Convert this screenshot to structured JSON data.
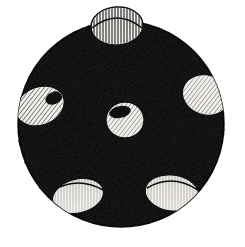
{
  "figure": {
    "style": "pen-and-ink engraving / woodcut stipple",
    "alt_text": "A large black stippled circle occupying most of the frame, with six pale oval craters hatched with fine ink lines; one crater forms a dome bulging above the top edge of the circle.",
    "canvas": {
      "width": 245,
      "height": 247,
      "background_color": "#ffffff"
    },
    "body": {
      "name": "sphere-disc",
      "shape": "circle",
      "center_x": 121,
      "center_y": 124,
      "radius": 103,
      "fill_color": "#0b0b0b",
      "texture": "dense random stipple grain",
      "outline_color": "#000000"
    },
    "craters": [
      {
        "name": "crater-top-dome",
        "position": "top",
        "center_x": 117,
        "center_y": 26,
        "radius_x": 26,
        "radius_y": 19,
        "rotation": -4,
        "fill_color": "#f2f0ec",
        "hatch": "vertical",
        "clipped": false,
        "protrudes_above_edge": true
      },
      {
        "name": "crater-left",
        "position": "left",
        "center_x": 40,
        "center_y": 106,
        "radius_x": 25,
        "radius_y": 19,
        "rotation": -22,
        "fill_color": "#f2f0ec",
        "hatch": "diagonal",
        "clipped": true,
        "protrudes_above_edge": false
      },
      {
        "name": "crater-right",
        "position": "right",
        "center_x": 206,
        "center_y": 95,
        "radius_x": 24,
        "radius_y": 20,
        "rotation": 18,
        "fill_color": "#f2f0ec",
        "hatch": "diagonal",
        "clipped": true,
        "protrudes_above_edge": false
      },
      {
        "name": "crater-center",
        "position": "center",
        "center_x": 125,
        "center_y": 120,
        "radius_x": 19,
        "radius_y": 18,
        "rotation": 0,
        "fill_color": "#f2f0ec",
        "hatch": "diagonal",
        "clipped": false,
        "protrudes_above_edge": false
      },
      {
        "name": "crater-bottom-left",
        "position": "bottom-left",
        "center_x": 78,
        "center_y": 196,
        "radius_x": 26,
        "radius_y": 17,
        "rotation": -14,
        "fill_color": "#f2f0ec",
        "hatch": "vertical",
        "clipped": false,
        "protrudes_above_edge": false
      },
      {
        "name": "crater-bottom-right",
        "position": "bottom-right",
        "center_x": 172,
        "center_y": 193,
        "radius_x": 27,
        "radius_y": 18,
        "rotation": 8,
        "fill_color": "#f2f0ec",
        "hatch": "vertical",
        "clipped": false,
        "protrudes_above_edge": false
      }
    ],
    "counts": {
      "crater_count": 6
    }
  }
}
